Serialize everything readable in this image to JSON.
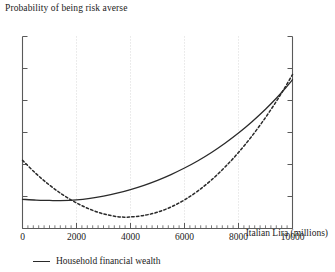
{
  "chart_data": {
    "type": "line",
    "title": "Probability of being risk averse",
    "xlabel": "Italian Lira (millions)",
    "ylabel": "",
    "xlim": [
      0,
      10000
    ],
    "ylim": [
      0,
      1
    ],
    "grid": "vertical-dotted",
    "xticks": [
      0,
      2000,
      4000,
      6000,
      8000,
      10000
    ],
    "xtick_labels": [
      "0",
      "2000",
      "4000",
      "6000",
      "8000",
      "10000"
    ],
    "xminor_step": 200,
    "yticks_count": 7,
    "ytick_labels": [],
    "gridlines_x": [
      2000,
      4000,
      6000,
      8000
    ],
    "legend_position": "below-left",
    "series": [
      {
        "name": "Household financial wealth",
        "style": "solid",
        "color": "#2a2a2a",
        "in_legend": true,
        "x": [
          0,
          500,
          1000,
          1400,
          2000,
          2500,
          3000,
          3500,
          4000,
          4500,
          5000,
          5500,
          6000,
          6500,
          7000,
          7500,
          8000,
          8500,
          9000,
          9400,
          9700,
          10000
        ],
        "y": [
          0.152,
          0.148,
          0.146,
          0.145,
          0.149,
          0.157,
          0.169,
          0.184,
          0.203,
          0.225,
          0.251,
          0.281,
          0.315,
          0.353,
          0.396,
          0.444,
          0.497,
          0.556,
          0.621,
          0.678,
          0.725,
          0.775
        ]
      },
      {
        "name": "unlabeled-dashed-series",
        "style": "dashed",
        "color": "#2a2a2a",
        "in_legend": false,
        "x": [
          0,
          500,
          1000,
          1500,
          2000,
          2500,
          3000,
          3500,
          3800,
          4000,
          4500,
          5000,
          5500,
          6000,
          6500,
          7000,
          7500,
          8000,
          8500,
          9000,
          9400,
          9700,
          10000
        ],
        "y": [
          0.355,
          0.286,
          0.226,
          0.175,
          0.133,
          0.1,
          0.076,
          0.062,
          0.059,
          0.06,
          0.068,
          0.085,
          0.112,
          0.149,
          0.196,
          0.253,
          0.32,
          0.396,
          0.482,
          0.578,
          0.662,
          0.73,
          0.802
        ]
      }
    ]
  },
  "legend": {
    "label": "Household financial wealth"
  }
}
